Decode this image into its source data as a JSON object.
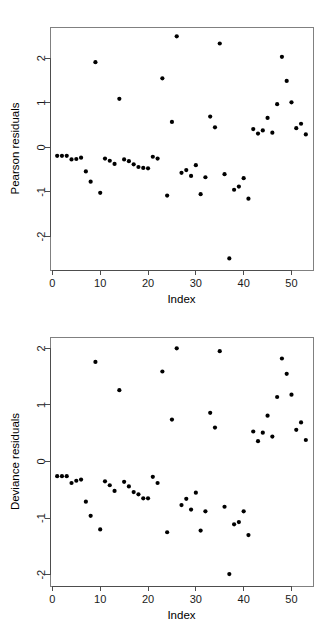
{
  "figure": {
    "background_color": "#ffffff",
    "point_color": "#000000",
    "axis_color": "#4d4d4d",
    "frame_color": "#808080"
  },
  "panels": [
    {
      "id": "pearson",
      "ylabel": "Pearson residuals",
      "xlabel": "Index"
    },
    {
      "id": "deviance",
      "ylabel": "Deviance residuals",
      "xlabel": "Index"
    }
  ],
  "chart_data": [
    {
      "type": "scatter",
      "title": "",
      "xlabel": "Index",
      "ylabel": "Pearson residuals",
      "xlim": [
        -0.5,
        54.5
      ],
      "ylim": [
        -2.75,
        2.7
      ],
      "xticks": [
        0,
        10,
        20,
        30,
        40,
        50
      ],
      "yticks": [
        -2,
        -1,
        0,
        1,
        2
      ],
      "grid": false,
      "legend": "none",
      "x": [
        1,
        2,
        3,
        4,
        5,
        6,
        7,
        8,
        9,
        10,
        11,
        12,
        13,
        14,
        15,
        16,
        17,
        18,
        19,
        20,
        21,
        22,
        23,
        24,
        25,
        26,
        27,
        28,
        29,
        30,
        31,
        32,
        33,
        34,
        35,
        36,
        37,
        38,
        39,
        40,
        41,
        42,
        43,
        44,
        45,
        46,
        47,
        48,
        49,
        50,
        51,
        52,
        53
      ],
      "y": [
        -0.19,
        -0.19,
        -0.19,
        -0.27,
        -0.26,
        -0.23,
        -0.54,
        -0.77,
        1.91,
        -1.02,
        -0.25,
        -0.3,
        -0.37,
        1.09,
        -0.27,
        -0.31,
        -0.38,
        -0.44,
        -0.46,
        -0.47,
        -0.21,
        -0.25,
        1.55,
        -1.08,
        0.57,
        2.49,
        -0.57,
        -0.51,
        -0.64,
        -0.4,
        -1.05,
        -0.67,
        0.69,
        0.45,
        2.33,
        -0.6,
        -2.49,
        -0.95,
        -0.88,
        -0.69,
        -1.15,
        0.41,
        0.31,
        0.38,
        0.66,
        0.33,
        0.97,
        2.03,
        1.49,
        1.01,
        0.43,
        0.53,
        0.29
      ]
    },
    {
      "type": "scatter",
      "title": "",
      "xlabel": "Index",
      "ylabel": "Deviance residuals",
      "xlim": [
        -0.5,
        54.5
      ],
      "ylim": [
        -2.2,
        2.2
      ],
      "xticks": [
        0,
        10,
        20,
        30,
        40,
        50
      ],
      "yticks": [
        -2,
        -1,
        0,
        1,
        2
      ],
      "grid": false,
      "legend": "none",
      "x": [
        1,
        2,
        3,
        4,
        5,
        6,
        7,
        8,
        9,
        10,
        11,
        12,
        13,
        14,
        15,
        16,
        17,
        18,
        19,
        20,
        21,
        22,
        23,
        24,
        25,
        26,
        27,
        28,
        29,
        30,
        31,
        32,
        33,
        34,
        35,
        36,
        37,
        38,
        39,
        40,
        41,
        42,
        43,
        44,
        45,
        46,
        47,
        48,
        49,
        50,
        51,
        52,
        53
      ],
      "y": [
        -0.26,
        -0.26,
        -0.26,
        -0.38,
        -0.34,
        -0.32,
        -0.71,
        -0.96,
        1.76,
        -1.2,
        -0.35,
        -0.42,
        -0.52,
        1.26,
        -0.36,
        -0.44,
        -0.54,
        -0.58,
        -0.65,
        -0.65,
        -0.27,
        -0.38,
        1.59,
        -1.25,
        0.74,
        2.0,
        -0.77,
        -0.66,
        -0.85,
        -0.55,
        -1.22,
        -0.88,
        0.86,
        0.6,
        1.95,
        -0.8,
        -1.99,
        -1.11,
        -1.07,
        -0.88,
        -1.3,
        0.53,
        0.36,
        0.51,
        0.81,
        0.44,
        1.14,
        1.82,
        1.55,
        1.18,
        0.56,
        0.69,
        0.38
      ]
    }
  ]
}
